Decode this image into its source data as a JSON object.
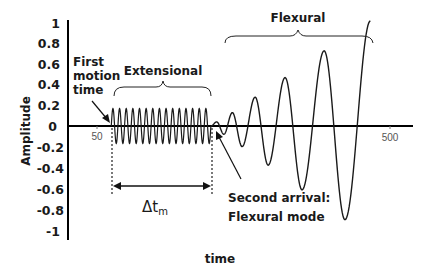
{
  "chart_data": {
    "type": "line",
    "title": "",
    "xlabel": "time",
    "ylabel": "Amplitude",
    "ylim": [
      -1,
      1
    ],
    "y_ticks": [
      "1",
      "0.8",
      "0.6",
      "0.4",
      "0.2",
      "0",
      "-0.2",
      "-0.4",
      "-0.6",
      "-0.8",
      "-1"
    ],
    "x_ticks": [
      "50",
      "500"
    ],
    "grid": false,
    "legend": null,
    "series": [
      {
        "name": "Extensional mode",
        "description": "Constant-amplitude high-frequency oscillation, ~15 cycles",
        "t_start": 72,
        "t_end": 225,
        "amplitude": 0.17
      },
      {
        "name": "Flexural mode",
        "description": "Growing lower-frequency oscillation",
        "peaks": [
          {
            "t": 234,
            "y": 0.04
          },
          {
            "t": 258,
            "y": 0.13
          },
          {
            "t": 293,
            "y": 0.28
          },
          {
            "t": 339,
            "y": 0.47
          },
          {
            "t": 399,
            "y": 0.73
          },
          {
            "t": 470,
            "y": 1.02
          }
        ],
        "troughs": [
          {
            "t": 245,
            "y": -0.08
          },
          {
            "t": 273,
            "y": -0.2
          },
          {
            "t": 313,
            "y": -0.38
          },
          {
            "t": 365,
            "y": -0.62
          },
          {
            "t": 431,
            "y": -0.91
          }
        ]
      }
    ],
    "annotations": [
      {
        "text": "First motion time",
        "lines": [
          "First",
          "motion",
          "time"
        ]
      },
      {
        "text": "Extensional"
      },
      {
        "text": "Flexural"
      },
      {
        "text": "Second arrival: Flexural mode",
        "lines": [
          "Second arrival:",
          "Flexural mode"
        ]
      },
      {
        "text": "Δt_m",
        "base": "Δt",
        "sub": "m"
      }
    ]
  },
  "labels": {
    "ylabel": "Amplitude",
    "xlabel": "time",
    "first_motion": [
      "First",
      "motion",
      "time"
    ],
    "extensional": "Extensional",
    "flexural": "Flexural",
    "second_arrival": [
      "Second arrival:",
      "Flexural mode"
    ],
    "delta_base": "Δt",
    "delta_sub": "m",
    "x_tick_50": "50",
    "x_tick_500": "500"
  },
  "colors": {
    "line": "#1a1a1a",
    "axis": "#000000",
    "text": "#1a1a1a",
    "tick_text": "#555555"
  }
}
